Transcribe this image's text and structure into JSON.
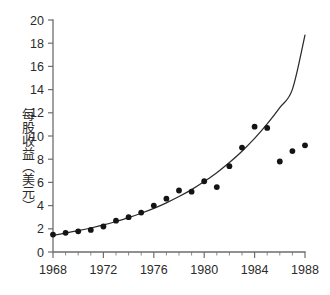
{
  "chart_data": {
    "type": "scatter",
    "title": "",
    "subtitle": "",
    "xlabel": "",
    "ylabel": "每股收益（美元）",
    "xlim": [
      1968,
      1988
    ],
    "ylim": [
      0,
      20
    ],
    "grid": false,
    "legend": "none",
    "x_ticks_major": [
      1968,
      1972,
      1976,
      1980,
      1984,
      1988
    ],
    "x_tick_labels": [
      "1968",
      "1972",
      "1976",
      "1980",
      "1984",
      "1988"
    ],
    "x_minor_step": 1,
    "y_ticks": [
      0,
      2,
      4,
      6,
      8,
      10,
      12,
      14,
      16,
      18,
      20
    ],
    "y_tick_labels": [
      "0",
      "2",
      "4",
      "6",
      "8",
      "10",
      "12",
      "14",
      "16",
      "18",
      "20"
    ],
    "series": [
      {
        "name": "每股收益",
        "type": "scatter",
        "marker": "filled-circle",
        "color": "#141414",
        "x": [
          1968,
          1969,
          1970,
          1971,
          1972,
          1973,
          1974,
          1975,
          1976,
          1977,
          1978,
          1979,
          1980,
          1981,
          1982,
          1983,
          1984,
          1985,
          1986,
          1987,
          1988
        ],
        "values": [
          1.5,
          1.65,
          1.78,
          1.9,
          2.2,
          2.7,
          3.0,
          3.4,
          4.0,
          4.6,
          5.3,
          5.2,
          6.1,
          5.6,
          7.4,
          9.0,
          10.8,
          10.7,
          7.8,
          8.7,
          9.2
        ]
      },
      {
        "name": "指数拟合曲线",
        "type": "line",
        "color": "#2b2b2b",
        "x": [
          1968,
          1969,
          1970,
          1971,
          1972,
          1973,
          1974,
          1975,
          1976,
          1977,
          1978,
          1979,
          1980,
          1981,
          1982,
          1983,
          1984,
          1985,
          1986,
          1987,
          1988
        ],
        "values": [
          1.45,
          1.63,
          1.84,
          2.07,
          2.33,
          2.63,
          2.96,
          3.34,
          3.76,
          4.24,
          4.78,
          5.38,
          6.07,
          6.84,
          7.71,
          8.69,
          9.79,
          11.04,
          12.44,
          14.02,
          18.7
        ]
      }
    ]
  }
}
